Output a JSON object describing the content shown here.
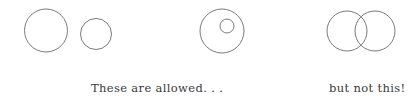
{
  "figure": {
    "background_color": "#ffffff",
    "stroke_color": "#6b6b6b",
    "text_color": "#3a3a3a",
    "width": 415,
    "height": 104
  },
  "captions": {
    "allowed": "These are allowed. . .",
    "not_allowed": "but not this!"
  },
  "groups": [
    {
      "name": "two-disjoint-circles",
      "verdict": "allowed",
      "circles": [
        {
          "name": "large-circle",
          "cx": 46,
          "cy": 30.5,
          "r": 21.5
        },
        {
          "name": "small-circle",
          "cx": 96,
          "cy": 34,
          "r": 15.5
        }
      ]
    },
    {
      "name": "nested-circles",
      "verdict": "allowed",
      "circles": [
        {
          "name": "outer-circle",
          "cx": 222,
          "cy": 31,
          "r": 22
        },
        {
          "name": "inner-circle",
          "cx": 227,
          "cy": 26,
          "r": 7
        }
      ]
    },
    {
      "name": "overlapping-circles",
      "verdict": "not-allowed",
      "circles": [
        {
          "name": "left-circle",
          "cx": 347,
          "cy": 31,
          "r": 20
        },
        {
          "name": "right-circle",
          "cx": 375,
          "cy": 31,
          "r": 20
        }
      ]
    }
  ],
  "stroke_width": 0.9
}
